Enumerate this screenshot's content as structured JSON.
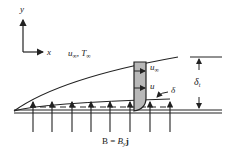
{
  "diagram": {
    "axes": {
      "y_label": "y",
      "x_label": "x"
    },
    "freestream_label": {
      "u": "u",
      "sub1": "∞",
      "sep": ", ",
      "T": "T",
      "sub2": "∞"
    },
    "profile_labels": {
      "u_inf": "u",
      "u_inf_sub": "∞",
      "u": "u"
    },
    "boundary_layer_label": "δ",
    "thermal_layer_label": {
      "delta": "δ",
      "sub": "t"
    },
    "field_label": {
      "B": "B",
      "eq": " = ",
      "By": "B",
      "By_sub": "y",
      "j": "j"
    },
    "colors": {
      "line": "#222222",
      "profile_fill": "#b8b8b8"
    },
    "field_arrow_x": [
      33,
      52,
      72,
      91,
      110,
      130,
      150,
      170
    ]
  }
}
